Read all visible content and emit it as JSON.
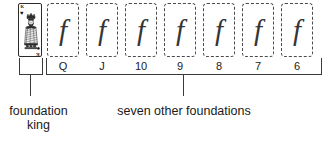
{
  "figure": {
    "type": "solitaire-foundation-layout-diagram",
    "foundation_king_card": {
      "rank": "K",
      "suit_top_symbol": "♥",
      "suit_bottom_symbol": "♠",
      "icon": "playing-card-king-icon"
    },
    "slot_glyph": "f",
    "slots": [
      {
        "rank_label": "Q",
        "glyph": "f"
      },
      {
        "rank_label": "J",
        "glyph": "f"
      },
      {
        "rank_label": "10",
        "glyph": "f"
      },
      {
        "rank_label": "9",
        "glyph": "f"
      },
      {
        "rank_label": "8",
        "glyph": "f"
      },
      {
        "rank_label": "7",
        "glyph": "f"
      },
      {
        "rank_label": "6",
        "glyph": "f"
      }
    ],
    "captions": {
      "king": "foundation\nking",
      "others": "seven other foundations"
    },
    "colors": {
      "background": "#ffffff",
      "ink": "#1a1a1a",
      "slot_border": "#4a4a4a",
      "bracket": "#3a3a3a",
      "glyph": "#353535"
    }
  }
}
